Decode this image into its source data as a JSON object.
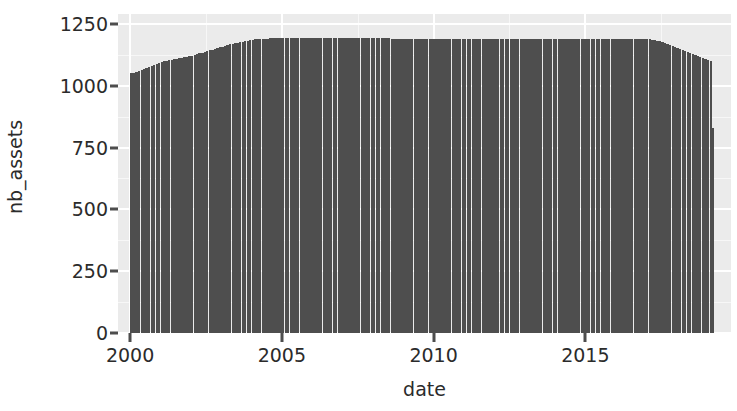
{
  "chart_data": {
    "type": "bar",
    "title": "",
    "subtitle": "",
    "xlabel": "date",
    "ylabel": "nb_assets",
    "xlim": [
      1999.6,
      2019.8
    ],
    "ylim": [
      0,
      1290
    ],
    "grid": true,
    "legend": null,
    "theme": "ggplot2-grey",
    "panel_background_color": "#ebebeb",
    "gridline_color": "#ffffff",
    "bar_color": "#4e4e4e",
    "axis_text_color": "#2b2b2b",
    "x_ticks": [
      2000,
      2005,
      2010,
      2015
    ],
    "x_tick_labels": [
      "2000",
      "2005",
      "2010",
      "2015"
    ],
    "y_ticks": [
      0,
      250,
      500,
      750,
      1000,
      1250
    ],
    "y_tick_labels": [
      "0",
      "250",
      "500",
      "750",
      "1000",
      "1250"
    ],
    "x_minor_ticks": [
      2002.5,
      2007.5,
      2012.5,
      2017.5
    ],
    "y_minor_ticks": [
      125,
      375,
      625,
      875,
      1125
    ],
    "series_name": "nb_assets",
    "bar_width_years": 0.0833,
    "note": "Monthly counts of number of assets from 2000-01 through 2019-03",
    "x": [
      2000.04,
      2000.13,
      2000.21,
      2000.29,
      2000.38,
      2000.46,
      2000.54,
      2000.63,
      2000.71,
      2000.79,
      2000.88,
      2000.96,
      2001.04,
      2001.13,
      2001.21,
      2001.29,
      2001.38,
      2001.46,
      2001.54,
      2001.63,
      2001.71,
      2001.79,
      2001.88,
      2001.96,
      2002.04,
      2002.13,
      2002.21,
      2002.29,
      2002.38,
      2002.46,
      2002.54,
      2002.63,
      2002.71,
      2002.79,
      2002.88,
      2002.96,
      2003.04,
      2003.13,
      2003.21,
      2003.29,
      2003.38,
      2003.46,
      2003.54,
      2003.63,
      2003.71,
      2003.79,
      2003.88,
      2003.96,
      2004.04,
      2004.13,
      2004.21,
      2004.29,
      2004.38,
      2004.46,
      2004.54,
      2004.63,
      2004.71,
      2004.79,
      2004.88,
      2004.96,
      2005.04,
      2005.13,
      2005.21,
      2005.29,
      2005.38,
      2005.46,
      2005.54,
      2005.63,
      2005.71,
      2005.79,
      2005.88,
      2005.96,
      2006.04,
      2006.13,
      2006.21,
      2006.29,
      2006.38,
      2006.46,
      2006.54,
      2006.63,
      2006.71,
      2006.79,
      2006.88,
      2006.96,
      2007.04,
      2007.13,
      2007.21,
      2007.29,
      2007.38,
      2007.46,
      2007.54,
      2007.63,
      2007.71,
      2007.79,
      2007.88,
      2007.96,
      2008.04,
      2008.13,
      2008.21,
      2008.29,
      2008.38,
      2008.46,
      2008.54,
      2008.63,
      2008.71,
      2008.79,
      2008.88,
      2008.96,
      2009.04,
      2009.13,
      2009.21,
      2009.29,
      2009.38,
      2009.46,
      2009.54,
      2009.63,
      2009.71,
      2009.79,
      2009.88,
      2009.96,
      2010.04,
      2010.13,
      2010.21,
      2010.29,
      2010.38,
      2010.46,
      2010.54,
      2010.63,
      2010.71,
      2010.79,
      2010.88,
      2010.96,
      2011.04,
      2011.13,
      2011.21,
      2011.29,
      2011.38,
      2011.46,
      2011.54,
      2011.63,
      2011.71,
      2011.79,
      2011.88,
      2011.96,
      2012.04,
      2012.13,
      2012.21,
      2012.29,
      2012.38,
      2012.46,
      2012.54,
      2012.63,
      2012.71,
      2012.79,
      2012.88,
      2012.96,
      2013.04,
      2013.13,
      2013.21,
      2013.29,
      2013.38,
      2013.46,
      2013.54,
      2013.63,
      2013.71,
      2013.79,
      2013.88,
      2013.96,
      2014.04,
      2014.13,
      2014.21,
      2014.29,
      2014.38,
      2014.46,
      2014.54,
      2014.63,
      2014.71,
      2014.79,
      2014.88,
      2014.96,
      2015.04,
      2015.13,
      2015.21,
      2015.29,
      2015.38,
      2015.46,
      2015.54,
      2015.63,
      2015.71,
      2015.79,
      2015.88,
      2015.96,
      2016.04,
      2016.13,
      2016.21,
      2016.29,
      2016.38,
      2016.46,
      2016.54,
      2016.63,
      2016.71,
      2016.79,
      2016.88,
      2016.96,
      2017.04,
      2017.13,
      2017.21,
      2017.29,
      2017.38,
      2017.46,
      2017.54,
      2017.63,
      2017.71,
      2017.79,
      2017.88,
      2017.96,
      2018.04,
      2018.13,
      2018.21,
      2018.29,
      2018.38,
      2018.46,
      2018.54,
      2018.63,
      2018.71,
      2018.79,
      2018.88,
      2018.96,
      2019.04,
      2019.13,
      2019.21
    ],
    "values": [
      1050,
      1052,
      1056,
      1060,
      1064,
      1068,
      1072,
      1076,
      1080,
      1084,
      1088,
      1092,
      1096,
      1100,
      1102,
      1104,
      1106,
      1108,
      1110,
      1112,
      1114,
      1116,
      1118,
      1120,
      1122,
      1125,
      1128,
      1131,
      1134,
      1137,
      1140,
      1143,
      1146,
      1149,
      1152,
      1155,
      1158,
      1161,
      1164,
      1167,
      1170,
      1172,
      1174,
      1176,
      1178,
      1180,
      1182,
      1184,
      1186,
      1187,
      1188,
      1189,
      1190,
      1190,
      1190,
      1191,
      1191,
      1191,
      1192,
      1192,
      1192,
      1192,
      1192,
      1193,
      1193,
      1193,
      1193,
      1193,
      1193,
      1194,
      1194,
      1194,
      1194,
      1194,
      1194,
      1194,
      1195,
      1195,
      1195,
      1195,
      1195,
      1195,
      1195,
      1195,
      1195,
      1195,
      1195,
      1195,
      1194,
      1194,
      1194,
      1194,
      1193,
      1193,
      1193,
      1192,
      1192,
      1192,
      1192,
      1191,
      1191,
      1191,
      1191,
      1190,
      1190,
      1190,
      1190,
      1190,
      1190,
      1190,
      1190,
      1190,
      1190,
      1190,
      1190,
      1190,
      1190,
      1190,
      1190,
      1190,
      1190,
      1190,
      1190,
      1190,
      1190,
      1190,
      1190,
      1190,
      1190,
      1190,
      1190,
      1190,
      1190,
      1190,
      1190,
      1190,
      1190,
      1190,
      1190,
      1190,
      1190,
      1190,
      1190,
      1190,
      1190,
      1190,
      1190,
      1190,
      1190,
      1190,
      1190,
      1190,
      1190,
      1190,
      1190,
      1190,
      1190,
      1190,
      1190,
      1190,
      1190,
      1190,
      1190,
      1190,
      1190,
      1190,
      1190,
      1190,
      1190,
      1190,
      1190,
      1190,
      1190,
      1190,
      1190,
      1190,
      1190,
      1190,
      1190,
      1190,
      1190,
      1190,
      1190,
      1190,
      1190,
      1190,
      1190,
      1190,
      1190,
      1190,
      1190,
      1190,
      1190,
      1190,
      1190,
      1190,
      1190,
      1190,
      1190,
      1190,
      1190,
      1189,
      1189,
      1188,
      1188,
      1187,
      1186,
      1184,
      1182,
      1179,
      1176,
      1172,
      1168,
      1164,
      1160,
      1156,
      1152,
      1148,
      1144,
      1140,
      1136,
      1132,
      1128,
      1124,
      1120,
      1116,
      1112,
      1108,
      1104,
      1100,
      830
    ]
  }
}
